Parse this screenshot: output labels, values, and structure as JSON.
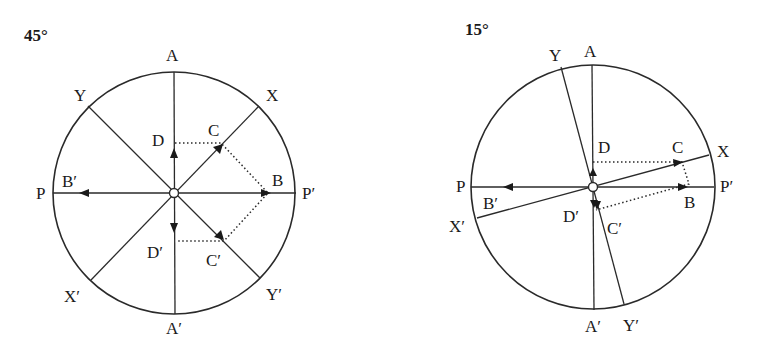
{
  "diagrams": [
    {
      "title": "45°",
      "labels": {
        "A": "A",
        "A_prime": "A′",
        "P": "P",
        "P_prime": "P′",
        "X": "X",
        "X_prime": "X′",
        "Y": "Y",
        "Y_prime": "Y′",
        "B": "B",
        "B_prime": "B′",
        "C": "C",
        "C_prime": "C′",
        "D": "D",
        "D_prime": "D′"
      },
      "angle_deg": 45
    },
    {
      "title": "15°",
      "labels": {
        "A": "A",
        "A_prime": "A′",
        "P": "P",
        "P_prime": "P′",
        "X": "X",
        "X_prime": "X′",
        "Y": "Y",
        "Y_prime": "Y′",
        "B": "B",
        "B_prime": "B′",
        "C": "C",
        "C_prime": "C′",
        "D": "D",
        "D_prime": "D′"
      },
      "angle_deg": 15
    }
  ]
}
